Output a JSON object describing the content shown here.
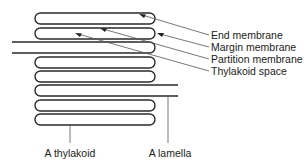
{
  "diagram": {
    "labels": {
      "end_membrane": "End membrane",
      "margin_membrane": "Margin membrane",
      "partition_membrane": "Partition membrane",
      "thylakoid_space": "Thylakoid space",
      "a_thylakoid": "A thylakoid",
      "a_lamella": "A lamella"
    },
    "structure": {
      "stacked_thylakoid_discs": 6,
      "stroma_lamellae": 2
    },
    "colors": {
      "stroke": "#2a2a2a",
      "leader": "#555555",
      "text": "#222222",
      "background": "#ffffff"
    }
  }
}
